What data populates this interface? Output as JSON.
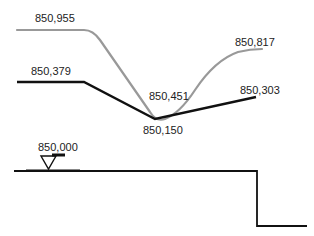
{
  "diagram": {
    "colors": {
      "upper_profile": "#999999",
      "lower_profile": "#111111",
      "ground_line": "#111111",
      "label_text": "#222222"
    },
    "upper_profile": {
      "labels": {
        "start": "850,955",
        "min": "850,451",
        "end": "850,817"
      }
    },
    "lower_profile": {
      "labels": {
        "start": "850,379",
        "min": "850,150",
        "end": "850,303"
      }
    },
    "reference_level": {
      "label": "850,000",
      "marker": "level-triangle-icon"
    }
  }
}
